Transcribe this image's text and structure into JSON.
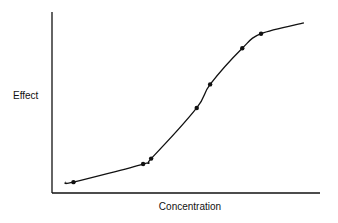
{
  "chart_data": {
    "type": "line",
    "title": "",
    "xlabel": "Concentration",
    "ylabel": "Effect",
    "grid": false,
    "legend": null,
    "x_ticks": [],
    "y_ticks": [],
    "xlim": [
      0,
      100
    ],
    "ylim": [
      0,
      100
    ],
    "series": [
      {
        "name": "sigmoid dose-response",
        "style": "smooth curve with markers",
        "points": [
          {
            "x": 8,
            "y": 6
          },
          {
            "x": 34,
            "y": 16
          },
          {
            "x": 37,
            "y": 19
          },
          {
            "x": 54,
            "y": 47
          },
          {
            "x": 59,
            "y": 60
          },
          {
            "x": 71,
            "y": 80
          },
          {
            "x": 78,
            "y": 88
          }
        ],
        "curve_start": {
          "x": 5,
          "y": 6
        },
        "curve_end": {
          "x": 94,
          "y": 94
        }
      }
    ]
  }
}
